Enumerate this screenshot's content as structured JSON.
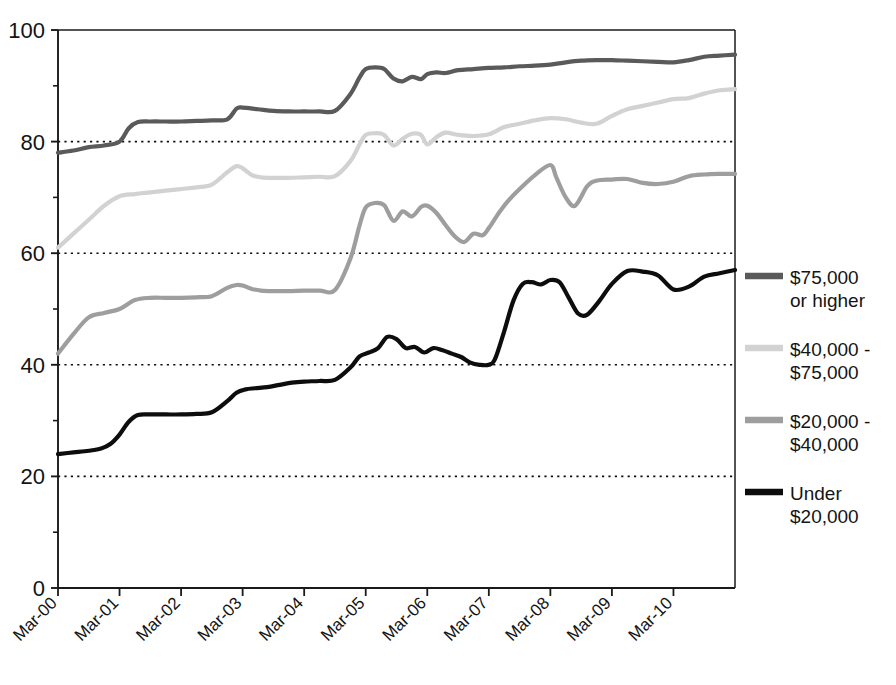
{
  "chart_data": {
    "type": "line",
    "title": "",
    "xlabel": "",
    "ylabel": "",
    "ylim": [
      0,
      100
    ],
    "grid": "horizontal dotted gridlines at 20, 40, 60, 80",
    "legend_position": "right",
    "y_ticks": [
      "0",
      "20",
      "40",
      "60",
      "80",
      "100"
    ],
    "y_minor_ticks": [
      10,
      30,
      50,
      70,
      90
    ],
    "x_ticks": [
      "Mar-00",
      "Mar-01",
      "Mar-02",
      "Mar-03",
      "Mar-04",
      "Mar-05",
      "Mar-06",
      "Mar-07",
      "Mar-08",
      "Mar-09",
      "Mar-10"
    ],
    "x_range_years": [
      0,
      11
    ],
    "series": [
      {
        "name": "$75,000 or higher",
        "color": "#5a5a5a",
        "legend_label_line1": "$75,000",
        "legend_label_line2": "or higher",
        "x": [
          0.0,
          0.25,
          0.5,
          0.75,
          1.0,
          1.15,
          1.3,
          1.5,
          1.75,
          2.0,
          2.25,
          2.5,
          2.75,
          2.9,
          3.0,
          3.25,
          3.5,
          3.75,
          4.0,
          4.25,
          4.5,
          4.75,
          4.9,
          5.0,
          5.15,
          5.3,
          5.45,
          5.6,
          5.75,
          5.9,
          6.0,
          6.15,
          6.3,
          6.5,
          6.75,
          7.0,
          7.25,
          7.5,
          7.75,
          8.0,
          8.25,
          8.5,
          8.75,
          9.0,
          9.25,
          9.5,
          9.75,
          10.0,
          10.25,
          10.5,
          10.75,
          11.0
        ],
        "y": [
          78.0,
          78.4,
          79.0,
          79.3,
          80.0,
          82.4,
          83.5,
          83.6,
          83.6,
          83.6,
          83.7,
          83.8,
          84.0,
          85.9,
          86.1,
          85.8,
          85.5,
          85.4,
          85.4,
          85.4,
          85.5,
          88.5,
          91.5,
          93.0,
          93.3,
          93.0,
          91.3,
          90.8,
          91.6,
          91.2,
          92.1,
          92.4,
          92.3,
          92.8,
          93.0,
          93.2,
          93.3,
          93.5,
          93.6,
          93.8,
          94.2,
          94.5,
          94.6,
          94.6,
          94.5,
          94.4,
          94.3,
          94.2,
          94.6,
          95.2,
          95.4,
          95.6
        ]
      },
      {
        "name": "$40,000 - $75,000",
        "color": "#d2d2d2",
        "legend_label_line1": "$40,000 -",
        "legend_label_line2": "$75,000",
        "x": [
          0.0,
          0.25,
          0.5,
          0.75,
          1.0,
          1.25,
          1.5,
          1.75,
          2.0,
          2.25,
          2.5,
          2.75,
          2.9,
          3.0,
          3.15,
          3.3,
          3.5,
          3.75,
          4.0,
          4.25,
          4.5,
          4.75,
          4.9,
          5.0,
          5.15,
          5.3,
          5.45,
          5.6,
          5.75,
          5.9,
          6.0,
          6.15,
          6.3,
          6.5,
          6.75,
          7.0,
          7.25,
          7.5,
          7.75,
          8.0,
          8.25,
          8.5,
          8.75,
          9.0,
          9.25,
          9.5,
          9.75,
          10.0,
          10.25,
          10.5,
          10.75,
          11.0
        ],
        "y": [
          61.0,
          63.5,
          66.0,
          68.5,
          70.2,
          70.6,
          70.9,
          71.2,
          71.5,
          71.8,
          72.3,
          74.5,
          75.6,
          75.2,
          74.0,
          73.6,
          73.5,
          73.5,
          73.6,
          73.7,
          73.8,
          76.5,
          79.5,
          81.2,
          81.5,
          81.2,
          79.3,
          80.5,
          81.4,
          81.2,
          79.5,
          80.8,
          81.6,
          81.2,
          81.0,
          81.3,
          82.6,
          83.2,
          83.8,
          84.2,
          84.0,
          83.4,
          83.2,
          84.6,
          85.8,
          86.4,
          87.0,
          87.6,
          87.8,
          88.6,
          89.2,
          89.4
        ]
      },
      {
        "name": "$20,000 - $40,000",
        "color": "#9e9e9e",
        "legend_label_line1": "$20,000 -",
        "legend_label_line2": "$40,000",
        "x": [
          0.0,
          0.25,
          0.5,
          0.75,
          1.0,
          1.25,
          1.5,
          1.75,
          2.0,
          2.25,
          2.5,
          2.75,
          2.9,
          3.0,
          3.15,
          3.3,
          3.5,
          3.75,
          4.0,
          4.25,
          4.5,
          4.75,
          4.9,
          5.0,
          5.15,
          5.3,
          5.45,
          5.6,
          5.75,
          5.9,
          6.0,
          6.15,
          6.3,
          6.45,
          6.6,
          6.75,
          6.9,
          7.0,
          7.15,
          7.3,
          7.5,
          7.75,
          8.0,
          8.1,
          8.25,
          8.4,
          8.6,
          8.75,
          9.0,
          9.25,
          9.5,
          9.75,
          10.0,
          10.25,
          10.5,
          10.75,
          11.0
        ],
        "y": [
          42.0,
          45.5,
          48.5,
          49.3,
          50.0,
          51.6,
          52.0,
          52.0,
          52.0,
          52.1,
          52.3,
          53.8,
          54.3,
          54.2,
          53.6,
          53.3,
          53.2,
          53.2,
          53.3,
          53.3,
          53.4,
          59.0,
          65.0,
          68.2,
          69.0,
          68.6,
          65.8,
          67.5,
          66.6,
          68.3,
          68.5,
          67.2,
          65.0,
          63.0,
          62.0,
          63.5,
          63.2,
          64.5,
          67.0,
          69.2,
          71.5,
          74.0,
          75.8,
          73.5,
          70.0,
          68.5,
          72.0,
          73.0,
          73.2,
          73.3,
          72.6,
          72.4,
          72.8,
          73.8,
          74.1,
          74.2,
          74.2
        ]
      },
      {
        "name": "Under $20,000",
        "color": "#0d0d0d",
        "legend_label_line1": "Under",
        "legend_label_line2": "$20,000",
        "x": [
          0.0,
          0.25,
          0.5,
          0.7,
          0.85,
          1.0,
          1.15,
          1.3,
          1.5,
          1.75,
          2.0,
          2.25,
          2.5,
          2.75,
          2.9,
          3.05,
          3.2,
          3.4,
          3.6,
          3.8,
          4.0,
          4.25,
          4.5,
          4.75,
          4.9,
          5.05,
          5.2,
          5.35,
          5.5,
          5.65,
          5.8,
          5.95,
          6.1,
          6.25,
          6.4,
          6.55,
          6.7,
          6.85,
          7.0,
          7.1,
          7.25,
          7.4,
          7.55,
          7.7,
          7.85,
          8.0,
          8.15,
          8.3,
          8.45,
          8.6,
          8.8,
          9.0,
          9.25,
          9.5,
          9.75,
          10.0,
          10.25,
          10.5,
          10.75,
          11.0
        ],
        "y": [
          24.0,
          24.3,
          24.6,
          25.0,
          25.8,
          27.5,
          29.8,
          31.0,
          31.1,
          31.1,
          31.1,
          31.2,
          31.5,
          33.5,
          35.0,
          35.6,
          35.8,
          36.0,
          36.4,
          36.8,
          37.0,
          37.1,
          37.3,
          39.5,
          41.5,
          42.2,
          43.0,
          45.0,
          44.6,
          43.0,
          43.2,
          42.2,
          43.0,
          42.6,
          42.0,
          41.4,
          40.4,
          40.0,
          40.0,
          41.0,
          46.0,
          51.5,
          54.5,
          54.8,
          54.4,
          55.2,
          54.8,
          52.0,
          49.2,
          49.0,
          51.5,
          54.5,
          56.8,
          56.7,
          56.0,
          53.5,
          54.0,
          55.8,
          56.4,
          57.0
        ]
      }
    ]
  },
  "partial_title": "",
  "legend": {
    "items": [
      {
        "label_line1": "$75,000",
        "label_line2": "or higher",
        "color": "#5a5a5a"
      },
      {
        "label_line1": "$40,000 -",
        "label_line2": "$75,000",
        "color": "#d2d2d2"
      },
      {
        "label_line1": "$20,000 -",
        "label_line2": "$40,000",
        "color": "#9e9e9e"
      },
      {
        "label_line1": "Under",
        "label_line2": "$20,000",
        "color": "#0d0d0d"
      }
    ]
  }
}
